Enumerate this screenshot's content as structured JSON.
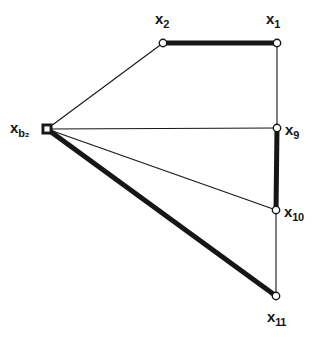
{
  "figure": {
    "type": "graph-diagram",
    "background_color": "#ffffff",
    "stroke_color": "#161616",
    "thin_stroke_width": 1.1,
    "thick_stroke_width": 5,
    "node_fill": "#ffffff",
    "width": 321,
    "height": 363
  },
  "nodes": [
    {
      "id": "xb2",
      "label_base": "x",
      "label_sub": "b₂",
      "label_text": "xb2",
      "marker": "square",
      "x": 47,
      "y": 129,
      "label_x": 10,
      "label_y": 120
    },
    {
      "id": "x2",
      "label_base": "x",
      "label_sub": "2",
      "label_text": "x2",
      "marker": "circle",
      "x": 163,
      "y": 43,
      "label_x": 155,
      "label_y": 11
    },
    {
      "id": "x1",
      "label_base": "x",
      "label_sub": "1",
      "label_text": "x1",
      "marker": "circle",
      "x": 277,
      "y": 43,
      "label_x": 266,
      "label_y": 11
    },
    {
      "id": "x9",
      "label_base": "x",
      "label_sub": "9",
      "label_text": "x9",
      "marker": "circle",
      "x": 277,
      "y": 128,
      "label_x": 285,
      "label_y": 122
    },
    {
      "id": "x10",
      "label_base": "x",
      "label_sub": "10",
      "label_text": "x10",
      "marker": "circle",
      "x": 276,
      "y": 210,
      "label_x": 284,
      "label_y": 204
    },
    {
      "id": "x11",
      "label_base": "x",
      "label_sub": "11",
      "label_text": "x11",
      "marker": "circle",
      "x": 276,
      "y": 296,
      "label_x": 267,
      "label_y": 309
    }
  ],
  "edges": [
    {
      "id": "edge-xb2-x2",
      "from": "xb2",
      "to": "x2",
      "weight": "thin",
      "x1": 47,
      "y1": 129,
      "x2": 163,
      "y2": 43
    },
    {
      "id": "edge-x2-x1",
      "from": "x2",
      "to": "x1",
      "weight": "thick",
      "x1": 163,
      "y1": 43,
      "x2": 277,
      "y2": 43
    },
    {
      "id": "edge-x1-x9",
      "from": "x1",
      "to": "x9",
      "weight": "thin",
      "x1": 277,
      "y1": 43,
      "x2": 277,
      "y2": 128
    },
    {
      "id": "edge-xb2-x9",
      "from": "xb2",
      "to": "x9",
      "weight": "thin",
      "x1": 47,
      "y1": 129,
      "x2": 277,
      "y2": 128
    },
    {
      "id": "edge-x9-x10",
      "from": "x9",
      "to": "x10",
      "weight": "thick",
      "x1": 277,
      "y1": 128,
      "x2": 276,
      "y2": 210
    },
    {
      "id": "edge-xb2-x10",
      "from": "xb2",
      "to": "x10",
      "weight": "thin",
      "x1": 47,
      "y1": 129,
      "x2": 276,
      "y2": 210
    },
    {
      "id": "edge-x10-x11",
      "from": "x10",
      "to": "x11",
      "weight": "thin",
      "x1": 276,
      "y1": 210,
      "x2": 276,
      "y2": 296
    },
    {
      "id": "edge-xb2-x11",
      "from": "xb2",
      "to": "x11",
      "weight": "thick",
      "x1": 47,
      "y1": 129,
      "x2": 276,
      "y2": 296
    }
  ]
}
